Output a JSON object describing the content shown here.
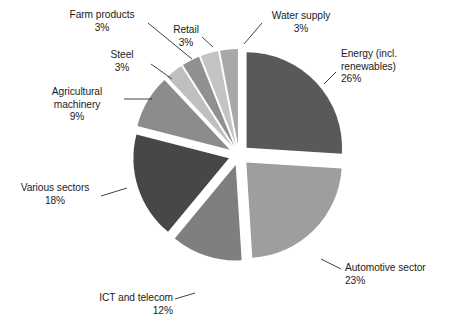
{
  "chart_data": {
    "type": "pie",
    "title": "",
    "subtitle": "",
    "xlabel": "",
    "ylabel": "",
    "legend_position": "none",
    "grid": false,
    "labels_show_percent": true,
    "exploded": true,
    "categories": [
      "Energy (incl. renewables)",
      "Automotive sector",
      "ICT and telecom",
      "Various sectors",
      "Agricultural machinery",
      "Steel",
      "Farm products",
      "Retail",
      "Water supply"
    ],
    "values": [
      26,
      23,
      12,
      18,
      9,
      3,
      3,
      3,
      3
    ],
    "colors": [
      "#595959",
      "#9e9e9e",
      "#7f7f7f",
      "#474747",
      "#8c8c8c",
      "#bfbfbf",
      "#909090",
      "#c4c4c4",
      "#a8a8a8"
    ],
    "slices": [
      {
        "name": "Energy (incl. renewables)",
        "value": 26,
        "percent_text": "26%",
        "label_line1": "Energy (incl.",
        "label_line2": "renewables)",
        "color": "#595959"
      },
      {
        "name": "Automotive sector",
        "value": 23,
        "percent_text": "23%",
        "label_line1": "Automotive sector",
        "label_line2": "",
        "color": "#9e9e9e"
      },
      {
        "name": "ICT and telecom",
        "value": 12,
        "percent_text": "12%",
        "label_line1": "ICT and telecom",
        "label_line2": "",
        "color": "#7f7f7f"
      },
      {
        "name": "Various sectors",
        "value": 18,
        "percent_text": "18%",
        "label_line1": "Various sectors",
        "label_line2": "",
        "color": "#474747"
      },
      {
        "name": "Agricultural machinery",
        "value": 9,
        "percent_text": "9%",
        "label_line1": "Agricultural",
        "label_line2": "machinery",
        "color": "#8c8c8c"
      },
      {
        "name": "Steel",
        "value": 3,
        "percent_text": "3%",
        "label_line1": "Steel",
        "label_line2": "",
        "color": "#bfbfbf"
      },
      {
        "name": "Farm products",
        "value": 3,
        "percent_text": "3%",
        "label_line1": "Farm products",
        "label_line2": "",
        "color": "#909090"
      },
      {
        "name": "Retail",
        "value": 3,
        "percent_text": "3%",
        "label_line1": "Retail",
        "label_line2": "",
        "color": "#c4c4c4"
      },
      {
        "name": "Water supply",
        "value": 3,
        "percent_text": "3%",
        "label_line1": "Water supply",
        "label_line2": "",
        "color": "#a8a8a8"
      }
    ]
  }
}
